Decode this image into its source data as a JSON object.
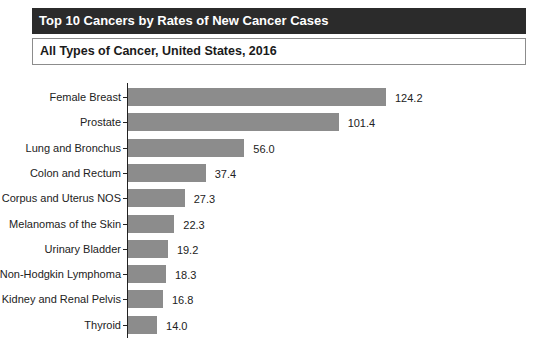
{
  "header": {
    "title": "Top 10 Cancers by Rates of New Cancer Cases",
    "subtitle": "All Types of Cancer, United States, 2016"
  },
  "colors": {
    "title_bg": "#2b2b2b",
    "title_text": "#ffffff",
    "bar": "#8c8c8c",
    "axis": "#222222"
  },
  "chart_data": {
    "type": "bar",
    "orientation": "horizontal",
    "title": "Top 10 Cancers by Rates of New Cancer Cases",
    "subtitle": "All Types of Cancer, United States, 2016",
    "xlabel": "",
    "ylabel": "",
    "grid": false,
    "legend": null,
    "data_labels": true,
    "categories": [
      "Female Breast",
      "Prostate",
      "Lung and Bronchus",
      "Colon and Rectum",
      "Corpus and Uterus NOS",
      "Melanomas of the Skin",
      "Urinary Bladder",
      "Non-Hodgkin Lymphoma",
      "Kidney and Renal Pelvis",
      "Thyroid"
    ],
    "values": [
      124.2,
      101.4,
      56.0,
      37.4,
      27.3,
      22.3,
      19.2,
      18.3,
      16.8,
      14.0
    ],
    "value_labels": [
      "124.2",
      "101.4",
      "56.0",
      "37.4",
      "27.3",
      "22.3",
      "19.2",
      "18.3",
      "16.8",
      "14.0"
    ]
  }
}
